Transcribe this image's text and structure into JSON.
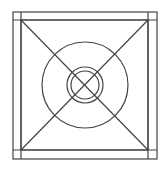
{
  "diagram": {
    "stroke_color": "#444444",
    "background": "#ffffff",
    "outer_square": {
      "x": 13,
      "y": 12,
      "w": 144,
      "h": 147
    },
    "inner_square": {
      "x": 21,
      "y": 20,
      "w": 127,
      "h": 130
    },
    "center": {
      "x": 85,
      "y": 85
    },
    "circles": [
      {
        "name": "large-circle",
        "r": 43
      },
      {
        "name": "ring-outer",
        "r": 18
      },
      {
        "name": "ring-inner",
        "r": 14
      }
    ]
  }
}
